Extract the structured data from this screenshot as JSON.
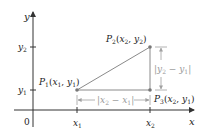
{
  "diagram": {
    "axes": {
      "x_label": "x",
      "y_label": "y",
      "origin_label": "0",
      "x_ticks": [
        "x",
        "x"
      ],
      "x_tick_subs": [
        "1",
        "2"
      ],
      "y_ticks": [
        "y",
        "y"
      ],
      "y_tick_subs": [
        "2",
        "1"
      ]
    },
    "points": {
      "p1": {
        "name": "P",
        "sub": "1",
        "coords": "(x",
        "c1sub": "1",
        "mid": ", y",
        "c2sub": "1",
        "close": ")"
      },
      "p2": {
        "name": "P",
        "sub": "2",
        "coords": "(x",
        "c1sub": "2",
        "mid": ", y",
        "c2sub": "2",
        "close": ")"
      },
      "p3": {
        "name": "P",
        "sub": "3",
        "coords": "(x",
        "c1sub": "2",
        "mid": ", y",
        "c2sub": "1",
        "close": ")"
      }
    },
    "distances": {
      "horizontal": {
        "open": "|x",
        "a": "2",
        "minus": " − x",
        "b": "1",
        "close": "|"
      },
      "vertical": {
        "open": "|y",
        "a": "2",
        "minus": " − y",
        "b": "1",
        "close": "|"
      }
    },
    "colors": {
      "axis": "#333333",
      "triangle": "#8a8a8a",
      "dimension": "#a0a0a0",
      "text": "#222222"
    }
  }
}
